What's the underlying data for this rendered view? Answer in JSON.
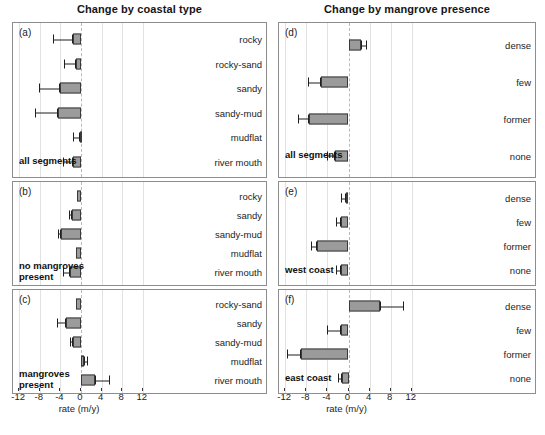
{
  "figure": {
    "columns": [
      {
        "id": "coastal",
        "title": "Change by coastal type"
      },
      {
        "id": "mangrove",
        "title": "Change by mangrove presence"
      }
    ],
    "axis": {
      "label": "rate (m/y)",
      "ticks": [
        "-12",
        "-8",
        "-4",
        "0",
        "4",
        "8",
        "12"
      ],
      "tick_values": [
        -12,
        -8,
        -4,
        0,
        4,
        8,
        12
      ],
      "min": -12.8,
      "max": 12.8
    },
    "bar_color": "#9b9b9b",
    "bar_edge_color": "#3a3a3a",
    "zero_line_color": "#b9b9b9",
    "grid_color": "#e2e2e2"
  },
  "chart_data": {
    "type": "bar",
    "xlabel": "rate (m/y)",
    "ylabel": "",
    "xlim": [
      -12.8,
      12.8
    ],
    "orientation": "horizontal",
    "grid": true,
    "legend": "none",
    "error_bars": "one-sided confidence interval",
    "panels": [
      {
        "letter": "(a)",
        "column": "coastal",
        "caption": "all segments",
        "categories": [
          "rocky",
          "rocky-sand",
          "sandy",
          "sandy-mud",
          "mudflat",
          "river mouth"
        ],
        "values": [
          -1.6,
          -0.9,
          -4.0,
          -4.5,
          -0.2,
          -1.5
        ],
        "err_low": [
          -5.4,
          -3.3,
          -8.1,
          -9.0,
          -1.6,
          -3.4
        ],
        "err_high": [
          -1.6,
          -0.9,
          -4.0,
          -4.5,
          -0.2,
          -1.5
        ]
      },
      {
        "letter": "(b)",
        "column": "coastal",
        "caption": "no mangroves\npresent",
        "categories": [
          "rocky",
          "sandy",
          "sandy-mud",
          "mudflat",
          "river mouth"
        ],
        "values": [
          -0.8,
          -1.7,
          -3.8,
          -0.9,
          -2.2
        ],
        "err_low": [
          -0.8,
          -2.3,
          -4.4,
          -0.9,
          -3.4
        ],
        "err_high": [
          -0.8,
          -1.7,
          -3.8,
          -0.9,
          -2.2
        ]
      },
      {
        "letter": "(c)",
        "column": "coastal",
        "caption": "mangroves\npresent",
        "categories": [
          "rocky-sand",
          "sandy",
          "sandy-mud",
          "mudflat",
          "river mouth"
        ],
        "values": [
          -0.9,
          -2.9,
          -1.5,
          0.5,
          2.8
        ],
        "err_low": [
          -0.9,
          -4.6,
          -2.1,
          0.5,
          2.8
        ],
        "err_high": [
          -0.9,
          -2.9,
          -1.5,
          1.3,
          5.6
        ]
      },
      {
        "letter": "(d)",
        "column": "mangrove",
        "caption": "all segments",
        "categories": [
          "dense",
          "few",
          "former",
          "none"
        ],
        "values": [
          2.3,
          -5.3,
          -7.4,
          -2.5
        ],
        "err_low": [
          2.3,
          -7.6,
          -9.6,
          -4.1
        ],
        "err_high": [
          3.6,
          -5.3,
          -7.4,
          -2.5
        ]
      },
      {
        "letter": "(e)",
        "column": "mangrove",
        "caption": "west coast",
        "categories": [
          "dense",
          "few",
          "former",
          "none"
        ],
        "values": [
          -0.5,
          -1.5,
          -5.9,
          -1.5
        ],
        "err_low": [
          -1.4,
          -2.3,
          -7.2,
          -2.4
        ],
        "err_high": [
          -0.5,
          -1.5,
          -5.9,
          -1.5
        ]
      },
      {
        "letter": "(f)",
        "column": "mangrove",
        "caption": "east coast",
        "categories": [
          "dense",
          "few",
          "former",
          "none"
        ],
        "values": [
          6.0,
          -1.5,
          -9.0,
          -1.2
        ],
        "err_low": [
          6.0,
          -4.0,
          -11.6,
          -1.9
        ],
        "err_high": [
          10.6,
          -1.5,
          -9.0,
          -1.2
        ]
      }
    ]
  }
}
